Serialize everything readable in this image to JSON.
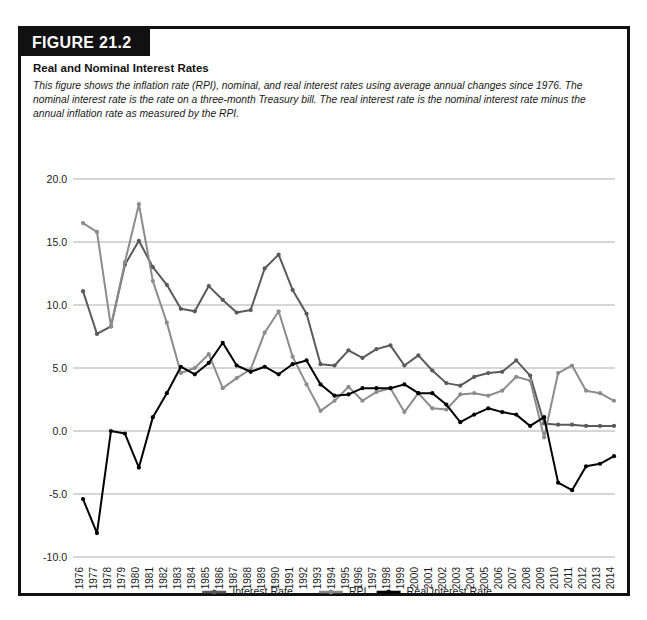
{
  "figure": {
    "banner_label": "FIGURE 21.2",
    "title": "Real and Nominal Interest Rates",
    "caption": "This figure shows the inflation rate (RPI), nominal, and real interest rates using average annual changes since 1976. The nominal interest rate is the rate on a three-month Treasury bill. The real interest rate is the nominal interest rate minus the annual inflation rate as measured by the RPI."
  },
  "colors": {
    "interest_rate": "#5a5a5a",
    "rpi": "#8c8c8c",
    "real_interest_rate": "#000000",
    "gridline": "#9a9a9a",
    "border": "#111111",
    "banner_bg": "#111111",
    "banner_text": "#ffffff"
  },
  "chart_data": {
    "type": "line",
    "title": "Real and Nominal Interest Rates",
    "xlabel": "",
    "ylabel": "",
    "grid": true,
    "legend_position": "bottom",
    "ylim": [
      -10.0,
      20.0
    ],
    "ytick_labels": [
      "20.0",
      "15.0",
      "10.0",
      "5.0",
      "0.0",
      "-5.0",
      "-10.0"
    ],
    "yticks": [
      20.0,
      15.0,
      10.0,
      5.0,
      0.0,
      -5.0,
      -10.0
    ],
    "categories": [
      "1976",
      "1977",
      "1978",
      "1979",
      "1980",
      "1981",
      "1982",
      "1983",
      "1984",
      "1985",
      "1986",
      "1987",
      "1988",
      "1989",
      "1990",
      "1991",
      "1992",
      "1993",
      "1994",
      "1995",
      "1996",
      "1997",
      "1998",
      "1999",
      "2000",
      "2001",
      "2002",
      "2003",
      "2004",
      "2005",
      "2006",
      "2007",
      "2008",
      "2009",
      "2010",
      "2011",
      "2012",
      "2013",
      "2014"
    ],
    "series": [
      {
        "name": "Interest Rate",
        "color": "#5a5a5a",
        "values": [
          11.1,
          7.7,
          8.3,
          13.2,
          15.1,
          13.0,
          11.6,
          9.7,
          9.5,
          11.5,
          10.4,
          9.4,
          9.6,
          12.9,
          14.0,
          11.2,
          9.3,
          5.3,
          5.2,
          6.4,
          5.8,
          6.5,
          6.8,
          5.2,
          6.0,
          4.8,
          3.8,
          3.6,
          4.3,
          4.6,
          4.7,
          5.6,
          4.4,
          0.6,
          0.5,
          0.5,
          0.4,
          0.4,
          0.4
        ]
      },
      {
        "name": "RPI",
        "color": "#8c8c8c",
        "values": [
          16.5,
          15.8,
          8.3,
          13.4,
          18.0,
          11.9,
          8.6,
          4.6,
          5.0,
          6.1,
          3.4,
          4.2,
          4.9,
          7.8,
          9.5,
          5.9,
          3.7,
          1.6,
          2.4,
          3.5,
          2.4,
          3.1,
          3.4,
          1.5,
          3.0,
          1.8,
          1.7,
          2.9,
          3.0,
          2.8,
          3.2,
          4.3,
          4.0,
          -0.5,
          4.6,
          5.2,
          3.2,
          3.0,
          2.4
        ]
      },
      {
        "name": "Real Interest Rate",
        "color": "#000000",
        "values": [
          -5.4,
          -8.1,
          0.0,
          -0.2,
          -2.9,
          1.1,
          3.0,
          5.1,
          4.5,
          5.4,
          7.0,
          5.2,
          4.7,
          5.1,
          4.5,
          5.3,
          5.6,
          3.7,
          2.8,
          2.9,
          3.4,
          3.4,
          3.4,
          3.7,
          3.0,
          3.0,
          2.1,
          0.7,
          1.3,
          1.8,
          1.5,
          1.3,
          0.4,
          1.1,
          -4.1,
          -4.7,
          -2.8,
          -2.6,
          -2.0
        ]
      }
    ]
  },
  "legend": {
    "items": [
      {
        "label": "Interest Rate",
        "color": "#5a5a5a"
      },
      {
        "label": "RPI",
        "color": "#8c8c8c"
      },
      {
        "label": "Real Interest Rate",
        "color": "#000000"
      }
    ]
  }
}
